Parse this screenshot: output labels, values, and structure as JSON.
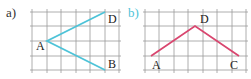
{
  "figure_a": {
    "label": "a)",
    "label_color": "#333333",
    "line_color": "#4ec3d8",
    "points": {
      "A": {
        "name": "A",
        "x": 47,
        "y": 41
      },
      "D": {
        "name": "D",
        "x": 105,
        "y": 12
      },
      "B": {
        "name": "B",
        "x": 105,
        "y": 70
      }
    },
    "path": [
      "D",
      "A",
      "B"
    ]
  },
  "figure_b": {
    "label": "b)",
    "label_color": "#4ec3d8",
    "line_color": "#d9466f",
    "points": {
      "A": {
        "name": "A",
        "x": 151,
        "y": 56
      },
      "D": {
        "name": "D",
        "x": 195,
        "y": 26
      },
      "C": {
        "name": "C",
        "x": 239,
        "y": 56
      }
    },
    "path": [
      "A",
      "D",
      "C"
    ]
  }
}
